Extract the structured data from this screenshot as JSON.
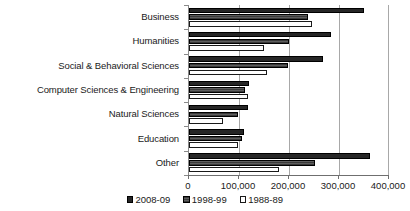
{
  "chart_data": {
    "type": "bar",
    "orientation": "horizontal",
    "title": "",
    "xlabel": "",
    "ylabel": "",
    "xlim": [
      0,
      400000
    ],
    "grid": true,
    "legend_position": "bottom",
    "xticks": [
      0,
      100000,
      200000,
      300000,
      400000
    ],
    "xticklabels": [
      "0",
      "100,000",
      "200,000",
      "300,000",
      "400,000"
    ],
    "categories": [
      "Business",
      "Humanities",
      "Social & Behavioral Sciences",
      "Computer Sciences & Engineering",
      "Natural Sciences",
      "Education",
      "Other"
    ],
    "series": [
      {
        "name": "2008-09",
        "color": "#262626",
        "values": [
          350000,
          283000,
          267000,
          120000,
          118000,
          110000,
          362000
        ]
      },
      {
        "name": "1998-99",
        "color": "#4d4d4d",
        "values": [
          238000,
          200000,
          198000,
          112000,
          97000,
          106000,
          252000
        ]
      },
      {
        "name": "1988-89",
        "color": "#ffffff",
        "values": [
          245000,
          150000,
          155000,
          118000,
          68000,
          98000,
          180000
        ]
      }
    ]
  }
}
